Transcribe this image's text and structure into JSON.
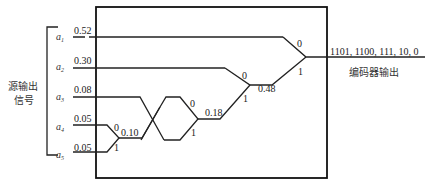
{
  "diagram": {
    "type": "huffman-encoder",
    "source_label_line1": "源输出",
    "source_label_line2": "信号",
    "output_label": "编码器输出",
    "output_codes": "1101, 1100, 111, 10, 0",
    "symbols": [
      {
        "name": "a",
        "sub": "1",
        "prob": "0.52"
      },
      {
        "name": "a",
        "sub": "2",
        "prob": "0.30"
      },
      {
        "name": "a",
        "sub": "3",
        "prob": "0.08"
      },
      {
        "name": "a",
        "sub": "4",
        "prob": "0.05"
      },
      {
        "name": "a",
        "sub": "5",
        "prob": "0.05"
      }
    ],
    "merges": [
      {
        "value": "0.10",
        "bit0": "0",
        "bit1": "1"
      },
      {
        "value": "0.18",
        "bit0": "0",
        "bit1": "1"
      },
      {
        "value": "0.48",
        "bit0": "0",
        "bit1": "1"
      },
      {
        "value": "",
        "bit0": "0",
        "bit1": "1"
      }
    ]
  }
}
